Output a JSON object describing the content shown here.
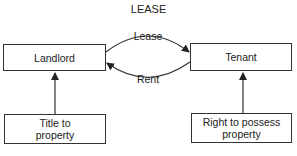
{
  "diagram": {
    "title": "LEASE",
    "nodes": {
      "landlord": "Landlord",
      "tenant": "Tenant",
      "title_to_property": "Title to property",
      "right_to_possess": "Right to possess property"
    },
    "edges": {
      "lease": "Lease",
      "rent": "Rent"
    }
  }
}
